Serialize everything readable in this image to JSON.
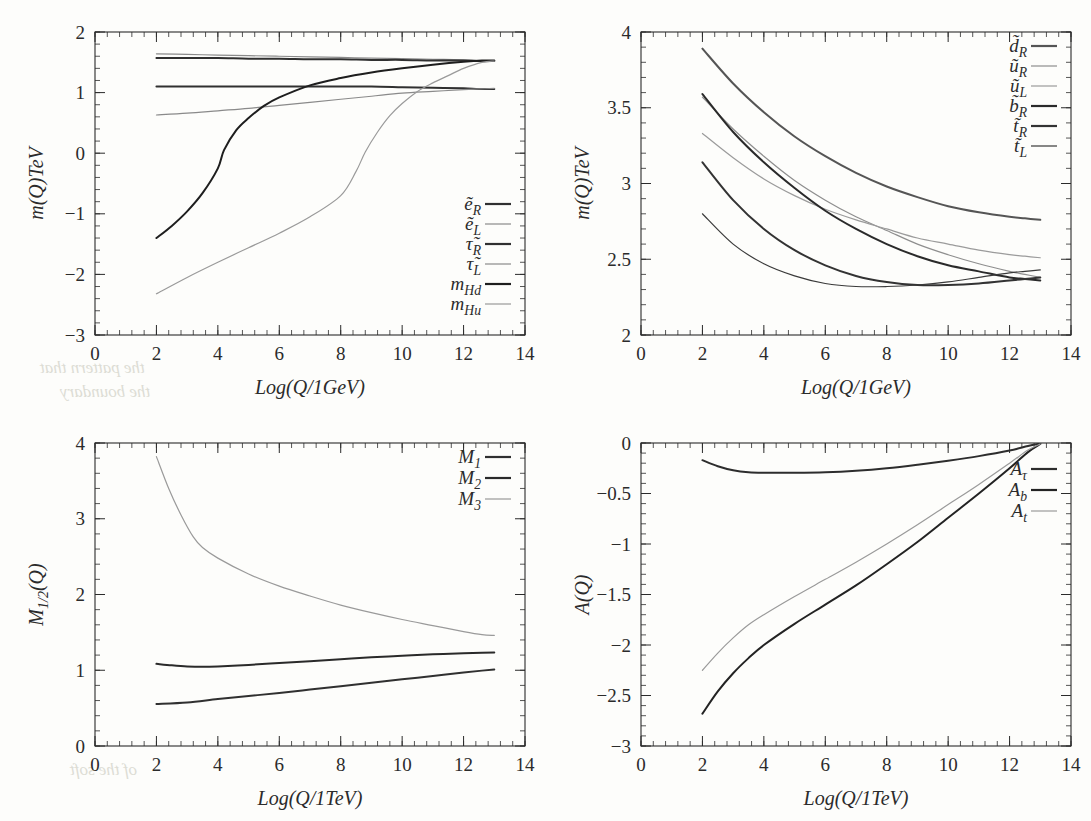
{
  "figure": {
    "kind": "four-panel-rge-running-plots",
    "background": "#fdfdfb",
    "ink": "#2b2b2b",
    "light_ink": "#8a8a8a"
  },
  "bleed_text": [
    {
      "text": "the pattern that",
      "x": 40,
      "y": 358,
      "size": 17
    },
    {
      "text": "the boundary",
      "x": 60,
      "y": 382,
      "size": 17
    },
    {
      "text": "of the soft",
      "x": 70,
      "y": 760,
      "size": 17
    }
  ],
  "chart_data": [
    {
      "id": "panel-top-left",
      "type": "line",
      "title": "",
      "xlabel": "Log(Q/1GeV)",
      "ylabel": "m(Q)TeV",
      "xlim": [
        0,
        14
      ],
      "ylim": [
        -3,
        2
      ],
      "xticks": [
        0,
        2,
        4,
        6,
        8,
        10,
        12,
        14
      ],
      "yticks": [
        -3,
        -2,
        -1,
        0,
        1,
        2
      ],
      "xtick_labels": [
        "0",
        "2",
        "4",
        "6",
        "8",
        "10",
        "12",
        "14"
      ],
      "ytick_labels": [
        "-3",
        "-2",
        "-1",
        "0",
        "1",
        "2"
      ],
      "minor_ticks": true,
      "grid": false,
      "legend_position": "lower-right-inside",
      "series": [
        {
          "name": "ẽ_R",
          "label_html": "<i>ẽ</i><sub>R</sub>",
          "weight": "bold",
          "color": "#303030",
          "x": [
            2,
            3,
            4,
            5,
            6,
            7,
            8,
            9,
            10,
            11,
            12,
            12.5,
            13
          ],
          "y": [
            1.1,
            1.1,
            1.1,
            1.1,
            1.1,
            1.1,
            1.1,
            1.1,
            1.09,
            1.08,
            1.07,
            1.06,
            1.06
          ]
        },
        {
          "name": "ẽ_L",
          "label_html": "<i>ẽ</i><sub>L</sub>",
          "weight": "thin",
          "color": "#8a8a8a",
          "x": [
            2,
            3,
            4,
            5,
            6,
            7,
            8,
            9,
            10,
            11,
            12,
            12.5,
            13
          ],
          "y": [
            1.64,
            1.63,
            1.62,
            1.61,
            1.6,
            1.59,
            1.58,
            1.57,
            1.56,
            1.55,
            1.54,
            1.53,
            1.53
          ]
        },
        {
          "name": "τ̃_R",
          "label_html": "<i>τ̃</i><sub>R</sub>",
          "weight": "bold",
          "color": "#303030",
          "x": [
            2,
            3,
            4,
            5,
            6,
            7,
            8,
            9,
            10,
            11,
            12,
            12.5,
            13
          ],
          "y": [
            1.57,
            1.57,
            1.57,
            1.56,
            1.56,
            1.55,
            1.55,
            1.54,
            1.54,
            1.53,
            1.53,
            1.52,
            1.52
          ]
        },
        {
          "name": "τ̃_L",
          "label_html": "<i>τ̃</i><sub>L</sub>",
          "weight": "thin",
          "color": "#8a8a8a",
          "x": [
            2,
            3,
            4,
            5,
            6,
            7,
            8,
            9,
            10,
            11,
            12,
            12.5,
            13
          ],
          "y": [
            0.63,
            0.66,
            0.7,
            0.74,
            0.79,
            0.84,
            0.89,
            0.94,
            0.99,
            1.02,
            1.05,
            1.06,
            1.07
          ]
        },
        {
          "name": "m_Hd",
          "label_html": "<i>m<sub>H<sub>d</sub></sub></i>",
          "weight": "bold",
          "color": "#1e1e1e",
          "x": [
            2,
            2.5,
            3,
            3.5,
            4,
            4.2,
            4.6,
            5,
            5.5,
            6,
            7,
            8,
            9,
            10,
            11,
            12,
            12.6,
            13
          ],
          "y": [
            -1.4,
            -1.2,
            -0.96,
            -0.66,
            -0.25,
            0.05,
            0.38,
            0.58,
            0.78,
            0.92,
            1.12,
            1.24,
            1.33,
            1.4,
            1.46,
            1.51,
            1.53,
            1.53
          ]
        },
        {
          "name": "m_Hu",
          "label_html": "<i>m<sub>H<sub>u</sub></sub></i>",
          "weight": "thin",
          "color": "#9a9a9a",
          "x": [
            2,
            3,
            4,
            5,
            6,
            7,
            8,
            8.5,
            8.8,
            9.2,
            9.6,
            10,
            10.5,
            11,
            11.5,
            12,
            12.6,
            13
          ],
          "y": [
            -2.32,
            -2.05,
            -1.8,
            -1.56,
            -1.32,
            -1.05,
            -0.7,
            -0.3,
            0.02,
            0.35,
            0.62,
            0.82,
            1.02,
            1.16,
            1.28,
            1.4,
            1.5,
            1.52
          ]
        }
      ]
    },
    {
      "id": "panel-top-right",
      "type": "line",
      "title": "",
      "xlabel": "Log(Q/1GeV)",
      "ylabel": "m(Q)TeV",
      "xlim": [
        0,
        14
      ],
      "ylim": [
        2,
        4
      ],
      "xticks": [
        0,
        2,
        4,
        6,
        8,
        10,
        12,
        14
      ],
      "yticks": [
        2,
        2.5,
        3,
        3.5,
        4
      ],
      "xtick_labels": [
        "0",
        "2",
        "4",
        "6",
        "8",
        "10",
        "12",
        "14"
      ],
      "ytick_labels": [
        "2",
        "2.5",
        "3",
        "3.5",
        "4"
      ],
      "minor_ticks": true,
      "grid": false,
      "legend_position": "upper-right-inside",
      "series": [
        {
          "name": "d̃_R",
          "label_html": "<i>d̃</i><sub>R</sub>",
          "weight": "bold",
          "color": "#555555",
          "x": [
            2,
            3,
            4,
            5,
            6,
            7,
            8,
            9,
            10,
            11,
            12,
            12.5,
            13
          ],
          "y": [
            3.89,
            3.66,
            3.47,
            3.31,
            3.18,
            3.07,
            2.98,
            2.91,
            2.85,
            2.81,
            2.78,
            2.77,
            2.76
          ]
        },
        {
          "name": "ũ_R",
          "label_html": "<i>ũ</i><sub>R</sub>",
          "weight": "thin",
          "color": "#8e8e8e",
          "x": [
            2,
            3,
            4,
            5,
            6,
            7,
            8,
            9,
            10,
            11,
            12,
            12.5,
            13
          ],
          "y": [
            3.57,
            3.36,
            3.18,
            3.02,
            2.89,
            2.78,
            2.69,
            2.6,
            2.53,
            2.47,
            2.42,
            2.4,
            2.38
          ]
        },
        {
          "name": "ũ_L",
          "label_html": "<i>ũ</i><sub>L</sub>",
          "weight": "thin",
          "color": "#9b9b9b",
          "x": [
            2,
            3,
            4,
            5,
            6,
            7,
            8,
            9,
            10,
            11,
            12,
            12.5,
            13
          ],
          "y": [
            3.33,
            3.17,
            3.03,
            2.92,
            2.83,
            2.76,
            2.7,
            2.64,
            2.6,
            2.56,
            2.53,
            2.52,
            2.51
          ]
        },
        {
          "name": "b̃_R",
          "label_html": "<i>b̃</i><sub>R</sub>",
          "weight": "bold",
          "color": "#2a2a2a",
          "x": [
            2,
            3,
            4,
            5,
            6,
            7,
            8,
            9,
            10,
            11,
            12,
            12.5,
            13
          ],
          "y": [
            3.59,
            3.34,
            3.14,
            2.97,
            2.82,
            2.7,
            2.6,
            2.52,
            2.46,
            2.42,
            2.38,
            2.37,
            2.36
          ]
        },
        {
          "name": "t̃_R",
          "label_html": "<i>t̃</i><sub>R</sub>",
          "weight": "bold",
          "color": "#333333",
          "x": [
            2,
            3,
            4,
            5,
            6,
            7,
            8,
            9,
            10,
            11,
            12,
            12.5,
            13
          ],
          "y": [
            3.14,
            2.89,
            2.7,
            2.56,
            2.46,
            2.39,
            2.35,
            2.33,
            2.33,
            2.34,
            2.36,
            2.37,
            2.38
          ]
        },
        {
          "name": "t̃_L",
          "label_html": "<i>t̃</i><sub>L</sub>",
          "weight": "thin",
          "color": "#3a3a3a",
          "x": [
            2,
            3,
            4,
            5,
            6,
            7,
            8,
            9,
            10,
            11,
            12,
            12.5,
            13
          ],
          "y": [
            2.8,
            2.6,
            2.47,
            2.39,
            2.34,
            2.32,
            2.32,
            2.33,
            2.35,
            2.38,
            2.41,
            2.42,
            2.43
          ]
        }
      ]
    },
    {
      "id": "panel-bottom-left",
      "type": "line",
      "title": "",
      "xlabel": "Log(Q/1TeV)",
      "ylabel": "M_{1/2}(Q)",
      "xlim": [
        0,
        14
      ],
      "ylim": [
        0,
        4
      ],
      "xticks": [
        0,
        2,
        4,
        6,
        8,
        10,
        12,
        14
      ],
      "yticks": [
        0,
        1,
        2,
        3,
        4
      ],
      "xtick_labels": [
        "0",
        "2",
        "4",
        "6",
        "8",
        "10",
        "12",
        "14"
      ],
      "ytick_labels": [
        "0",
        "1",
        "2",
        "3",
        "4"
      ],
      "minor_ticks": true,
      "grid": false,
      "legend_position": "upper-right-inside",
      "series": [
        {
          "name": "M_1",
          "label_html": "<i>M</i><sub>1</sub>",
          "weight": "bold",
          "color": "#303030",
          "x": [
            2,
            3,
            4,
            5,
            6,
            7,
            8,
            9,
            10,
            11,
            12,
            12.6,
            13
          ],
          "y": [
            0.555,
            0.575,
            0.62,
            0.66,
            0.7,
            0.745,
            0.79,
            0.835,
            0.88,
            0.925,
            0.97,
            0.995,
            1.01
          ]
        },
        {
          "name": "M_2",
          "label_html": "<i>M</i><sub>2</sub>",
          "weight": "bold",
          "color": "#2a2a2a",
          "x": [
            2,
            2.5,
            3,
            3.5,
            4,
            5,
            6,
            7,
            8,
            9,
            10,
            11,
            12,
            12.6,
            13
          ],
          "y": [
            1.085,
            1.065,
            1.05,
            1.045,
            1.05,
            1.07,
            1.095,
            1.12,
            1.145,
            1.17,
            1.19,
            1.21,
            1.225,
            1.232,
            1.235
          ]
        },
        {
          "name": "M_3",
          "label_html": "<i>M</i><sub>3</sub>",
          "weight": "thin",
          "color": "#9a9a9a",
          "x": [
            2,
            2.4,
            2.8,
            3.2,
            3.5,
            4,
            5,
            6,
            7,
            8,
            9,
            10,
            11,
            12,
            12.6,
            13
          ],
          "y": [
            3.82,
            3.4,
            3.05,
            2.76,
            2.62,
            2.48,
            2.27,
            2.11,
            1.98,
            1.86,
            1.76,
            1.67,
            1.59,
            1.51,
            1.47,
            1.46
          ]
        }
      ]
    },
    {
      "id": "panel-bottom-right",
      "type": "line",
      "title": "",
      "xlabel": "Log(Q/1TeV)",
      "ylabel": "A(Q)",
      "xlim": [
        0,
        14
      ],
      "ylim": [
        -3,
        0
      ],
      "xticks": [
        0,
        2,
        4,
        6,
        8,
        10,
        12,
        14
      ],
      "yticks": [
        -3,
        -2.5,
        -2,
        -1.5,
        -1,
        -0.5,
        0
      ],
      "xtick_labels": [
        "0",
        "2",
        "4",
        "6",
        "8",
        "10",
        "12",
        "14"
      ],
      "ytick_labels": [
        "-3",
        "-2.5",
        "-2",
        "-1.5",
        "-1",
        "-0.5",
        "0"
      ],
      "minor_ticks": true,
      "grid": false,
      "legend_position": "right-upper-inside",
      "series": [
        {
          "name": "A_τ",
          "label_html": "<i>A<sub>τ</sub></i>",
          "weight": "bold",
          "color": "#2d2d2d",
          "x": [
            2,
            2.5,
            3,
            3.5,
            4,
            5,
            6,
            7,
            8,
            9,
            10,
            11,
            12,
            12.6,
            13
          ],
          "y": [
            -0.17,
            -0.23,
            -0.27,
            -0.29,
            -0.295,
            -0.295,
            -0.29,
            -0.275,
            -0.25,
            -0.215,
            -0.175,
            -0.13,
            -0.075,
            -0.03,
            -0.005
          ]
        },
        {
          "name": "A_b",
          "label_html": "<i>A<sub>b</sub></i>",
          "weight": "bold",
          "color": "#232323",
          "x": [
            2,
            2.5,
            3,
            3.5,
            4,
            5,
            6,
            7,
            8,
            9,
            10,
            11,
            12,
            12.6,
            13
          ],
          "y": [
            -2.68,
            -2.46,
            -2.28,
            -2.13,
            -2.0,
            -1.79,
            -1.6,
            -1.41,
            -1.2,
            -0.98,
            -0.74,
            -0.5,
            -0.25,
            -0.09,
            -0.01
          ]
        },
        {
          "name": "A_t",
          "label_html": "<i>A<sub>t</sub></i>",
          "weight": "thin",
          "color": "#9a9a9a",
          "x": [
            2,
            2.5,
            3,
            3.5,
            4,
            5,
            6,
            7,
            8,
            9,
            10,
            11,
            12,
            12.6,
            13
          ],
          "y": [
            -2.25,
            -2.08,
            -1.93,
            -1.8,
            -1.7,
            -1.52,
            -1.35,
            -1.18,
            -1.0,
            -0.81,
            -0.61,
            -0.41,
            -0.2,
            -0.07,
            -0.01
          ]
        }
      ]
    }
  ]
}
